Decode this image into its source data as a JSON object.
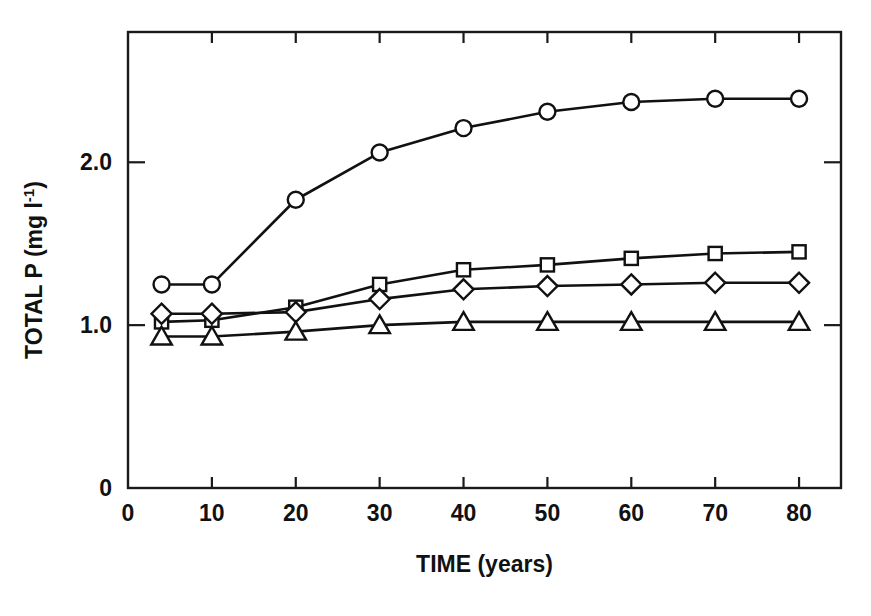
{
  "chart_data": {
    "type": "line",
    "title": "",
    "xlabel": "TIME (years)",
    "ylabel": "TOTAL P (mg l-1)",
    "ylabel_main": "TOTAL P (mg l",
    "ylabel_sup": "-1",
    "ylabel_tail": ")",
    "xlim": [
      0,
      85
    ],
    "ylim": [
      0,
      2.8
    ],
    "grid": false,
    "legend": "none",
    "x_ticks": [
      0,
      10,
      20,
      30,
      40,
      50,
      60,
      70,
      80
    ],
    "x_tick_labels": [
      "0",
      "10",
      "20",
      "30",
      "40",
      "50",
      "60",
      "70",
      "80"
    ],
    "y_ticks": [
      0,
      1.0,
      2.0
    ],
    "y_tick_labels": [
      "0",
      "1.0",
      "2.0"
    ],
    "x": [
      4,
      10,
      20,
      30,
      40,
      50,
      60,
      70,
      80
    ],
    "series": [
      {
        "name": "circle-series",
        "marker": "circle",
        "values": [
          1.25,
          1.25,
          1.77,
          2.06,
          2.21,
          2.31,
          2.37,
          2.39,
          2.39
        ]
      },
      {
        "name": "square-series",
        "marker": "square",
        "values": [
          1.02,
          1.03,
          1.11,
          1.25,
          1.34,
          1.37,
          1.41,
          1.44,
          1.45
        ]
      },
      {
        "name": "diamond-series",
        "marker": "diamond",
        "values": [
          1.07,
          1.07,
          1.08,
          1.16,
          1.22,
          1.24,
          1.25,
          1.26,
          1.26
        ]
      },
      {
        "name": "triangle-series",
        "marker": "triangle",
        "values": [
          0.93,
          0.93,
          0.96,
          1.0,
          1.02,
          1.02,
          1.02,
          1.02,
          1.02
        ]
      }
    ],
    "colors": {
      "line": "#111111",
      "marker_fill": "#ffffff",
      "axis": "#1a1a1a",
      "background": "#ffffff"
    }
  }
}
